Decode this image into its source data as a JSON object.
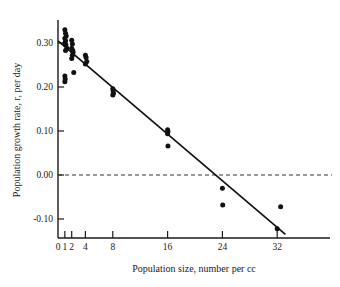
{
  "chart_data": {
    "type": "scatter",
    "title": "",
    "xlabel": "Population size, number per cc",
    "ylabel": "Population growth rate, r, per day",
    "xlim": [
      0,
      35
    ],
    "ylim": [
      -0.135,
      0.345
    ],
    "grid": false,
    "legend": null,
    "xticks": [
      0,
      1,
      2,
      4,
      8,
      16,
      24,
      32
    ],
    "xticklabels": [
      "0",
      "1",
      "2",
      "4",
      "8",
      "16",
      "24",
      "32"
    ],
    "yticks": [
      -0.1,
      0.0,
      0.1,
      0.2,
      0.3
    ],
    "yticklabels": [
      "-0.10",
      "0.00",
      "0.10",
      "0.20",
      "0.30"
    ],
    "series": [
      {
        "name": "observations",
        "marker": "filled-circle",
        "color": "#111111",
        "points": [
          [
            1.0,
            0.33
          ],
          [
            1.1,
            0.322
          ],
          [
            1.2,
            0.316
          ],
          [
            1.0,
            0.311
          ],
          [
            1.1,
            0.305
          ],
          [
            1.0,
            0.3
          ],
          [
            1.15,
            0.296
          ],
          [
            1.3,
            0.288
          ],
          [
            1.1,
            0.283
          ],
          [
            1.0,
            0.225
          ],
          [
            1.05,
            0.218
          ],
          [
            1.0,
            0.212
          ],
          [
            2.0,
            0.306
          ],
          [
            2.1,
            0.298
          ],
          [
            2.0,
            0.288
          ],
          [
            2.15,
            0.283
          ],
          [
            2.2,
            0.279
          ],
          [
            2.1,
            0.272
          ],
          [
            2.0,
            0.265
          ],
          [
            2.3,
            0.233
          ],
          [
            4.0,
            0.272
          ],
          [
            4.1,
            0.267
          ],
          [
            4.2,
            0.258
          ],
          [
            4.0,
            0.252
          ],
          [
            8.0,
            0.196
          ],
          [
            8.05,
            0.191
          ],
          [
            8.1,
            0.186
          ],
          [
            8.0,
            0.182
          ],
          [
            16.0,
            0.103
          ],
          [
            16.05,
            0.099
          ],
          [
            16.0,
            0.094
          ],
          [
            16.05,
            0.066
          ],
          [
            24.0,
            -0.03
          ],
          [
            24.05,
            -0.068
          ],
          [
            32.5,
            -0.072
          ],
          [
            32.0,
            -0.122
          ]
        ]
      }
    ],
    "fit_line": {
      "name": "regression-line",
      "color": "#111111",
      "x": [
        0.0,
        33.2
      ],
      "y": [
        0.305,
        -0.135
      ]
    },
    "reference_line": {
      "name": "zero-line",
      "style": "dashed",
      "y": 0.0,
      "color": "#333333"
    }
  }
}
